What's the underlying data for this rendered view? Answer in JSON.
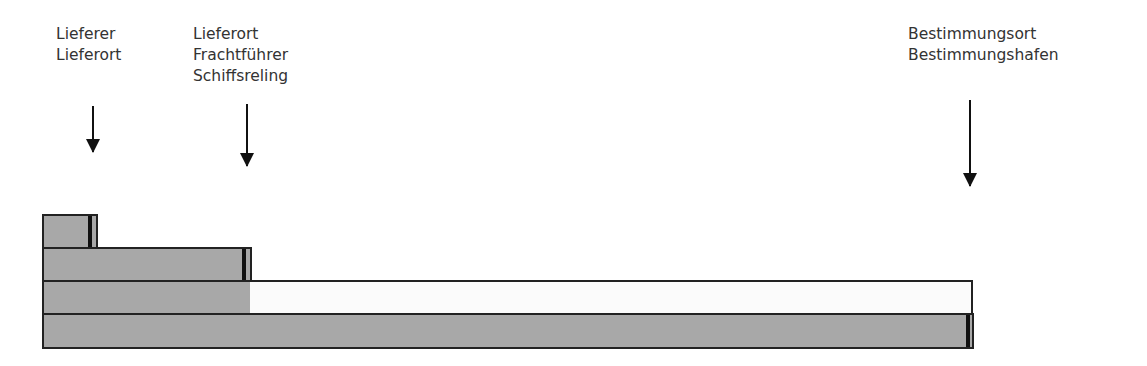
{
  "labels": [
    {
      "lines": [
        "Lieferer",
        "Lieferort"
      ]
    },
    {
      "lines": [
        "Lieferort",
        "Frachtführer",
        "Schiffsreling"
      ]
    },
    {
      "lines": [
        "Bestimmungsort",
        "Bestimmungshafen"
      ]
    }
  ],
  "colors": {
    "bar_fill": "#a8a8a8",
    "border": "#222222",
    "empty_fill": "#fbfbfb",
    "arrow": "#111111"
  },
  "bars": [
    {
      "name": "bar-1",
      "start_px": 42,
      "end_px": 97,
      "filled_to_px": 97
    },
    {
      "name": "bar-2",
      "start_px": 42,
      "end_px": 251,
      "filled_to_px": 251
    },
    {
      "name": "bar-3",
      "start_px": 42,
      "end_px": 972,
      "filled_to_px": 248
    },
    {
      "name": "bar-4",
      "start_px": 42,
      "end_px": 973,
      "filled_to_px": 973
    }
  ]
}
